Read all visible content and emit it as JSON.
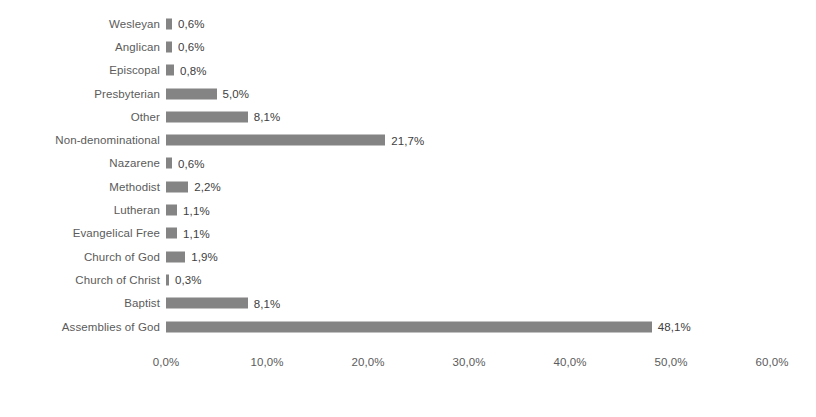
{
  "chart_data": {
    "type": "bar",
    "orientation": "horizontal",
    "title": "",
    "subtitle": "",
    "xlabel": "",
    "ylabel": "",
    "xlim": [
      0,
      60
    ],
    "grid": false,
    "legend": false,
    "bar_color": "#848484",
    "label_color": "#5b5b5b",
    "value_color": "#404040",
    "background": "#ffffff",
    "decimal_separator": ",",
    "x_tick_labels": [
      "0,0%",
      "10,0%",
      "20,0%",
      "30,0%",
      "40,0%",
      "50,0%",
      "60,0%"
    ],
    "x_tick_values": [
      0,
      10,
      20,
      30,
      40,
      50,
      60
    ],
    "categories": [
      "Wesleyan",
      "Anglican",
      "Episcopal",
      "Presbyterian",
      "Other",
      "Non-denominational",
      "Nazarene",
      "Methodist",
      "Lutheran",
      "Evangelical Free",
      "Church of God",
      "Church of Christ",
      "Baptist",
      "Assemblies of God"
    ],
    "values": [
      0.6,
      0.6,
      0.8,
      5.0,
      8.1,
      21.7,
      0.6,
      2.2,
      1.1,
      1.1,
      1.9,
      0.3,
      8.1,
      48.1
    ],
    "value_labels": [
      "0,6%",
      "0,6%",
      "0,8%",
      "5,0%",
      "8,1%",
      "21,7%",
      "0,6%",
      "2,2%",
      "1,1%",
      "1,1%",
      "1,9%",
      "0,3%",
      "8,1%",
      "48,1%"
    ],
    "rows": [
      {
        "category": "Wesleyan",
        "value": 0.6,
        "value_label": "0,6%"
      },
      {
        "category": "Anglican",
        "value": 0.6,
        "value_label": "0,6%"
      },
      {
        "category": "Episcopal",
        "value": 0.8,
        "value_label": "0,8%"
      },
      {
        "category": "Presbyterian",
        "value": 5.0,
        "value_label": "5,0%"
      },
      {
        "category": "Other",
        "value": 8.1,
        "value_label": "8,1%"
      },
      {
        "category": "Non-denominational",
        "value": 21.7,
        "value_label": "21,7%"
      },
      {
        "category": "Nazarene",
        "value": 0.6,
        "value_label": "0,6%"
      },
      {
        "category": "Methodist",
        "value": 2.2,
        "value_label": "2,2%"
      },
      {
        "category": "Lutheran",
        "value": 1.1,
        "value_label": "1,1%"
      },
      {
        "category": "Evangelical Free",
        "value": 1.1,
        "value_label": "1,1%"
      },
      {
        "category": "Church of God",
        "value": 1.9,
        "value_label": "1,9%"
      },
      {
        "category": "Church of Christ",
        "value": 0.3,
        "value_label": "0,3%"
      },
      {
        "category": "Baptist",
        "value": 8.1,
        "value_label": "8,1%"
      },
      {
        "category": "Assemblies of God",
        "value": 48.1,
        "value_label": "48,1%"
      }
    ]
  }
}
